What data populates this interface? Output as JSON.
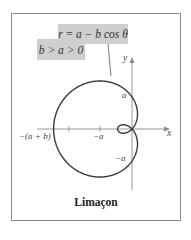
{
  "callouts": {
    "equation": "r = a − b cos θ",
    "condition": "b > a > 0"
  },
  "axes": {
    "x_label": "x",
    "y_label": "y"
  },
  "tick_labels": {
    "neg_a_plus_b": "−(a + b)",
    "neg_a_x": "−a",
    "a_y": "a",
    "neg_a_y": "−a"
  },
  "title": "Limaçon",
  "colors": {
    "frame": "#8a8a8a",
    "callout_bg": "#cfcfcf",
    "curve": "#3a3a3a",
    "axis": "#8a8a8a"
  },
  "chart_data": {
    "type": "polar-curve",
    "equation": "r = a - b cos θ",
    "condition": "b > a > 0",
    "title": "Limaçon",
    "params": {
      "a": 1,
      "b": 1.45
    },
    "pixel_scale": 32,
    "origin_px": [
      132,
      129
    ],
    "marked_points": [
      {
        "label": "-(a+b)",
        "x": -2.45,
        "y": 0
      },
      {
        "label": "-a",
        "x": -1,
        "y": 0
      },
      {
        "label": "a",
        "x": 0,
        "y": 1
      },
      {
        "label": "-a",
        "x": 0,
        "y": -1
      }
    ],
    "features": [
      "inner loop near origin",
      "outer loop extending left"
    ]
  }
}
